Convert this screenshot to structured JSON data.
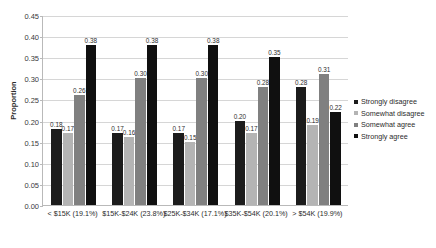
{
  "chart_data": {
    "type": "bar",
    "title": "",
    "xlabel": "",
    "ylabel": "Proportion",
    "ylim": [
      0.0,
      0.45
    ],
    "ytick_step": 0.05,
    "grid": true,
    "legend_position": "right",
    "categories": [
      "< $15K (19.1%)",
      "$15K-$24K (23.8%)",
      "$25K-$34K (17.1%)",
      "$35K-$54K (20.1%)",
      "> $54K (19.9%)"
    ],
    "ytick_labels": [
      "0.00",
      "0.05",
      "0.10",
      "0.15",
      "0.20",
      "0.25",
      "0.30",
      "0.35",
      "0.40",
      "0.45"
    ],
    "ytick_values": [
      0.0,
      0.05,
      0.1,
      0.15,
      0.2,
      0.25,
      0.3,
      0.35,
      0.4,
      0.45
    ],
    "series": [
      {
        "name": "Strongly disagree",
        "color": "#1c1c1c",
        "values": [
          0.18,
          0.17,
          0.17,
          0.2,
          0.28
        ],
        "labels": [
          "0.18",
          "0.17",
          "0.17",
          "0.20",
          "0.28"
        ]
      },
      {
        "name": "Somewhat disagree",
        "color": "#b4b4b4",
        "values": [
          0.17,
          0.16,
          0.15,
          0.17,
          0.19
        ],
        "labels": [
          "0.17",
          "0.16",
          "0.15",
          "0.17",
          "0.19"
        ]
      },
      {
        "name": "Somewhat agree",
        "color": "#808080",
        "values": [
          0.26,
          0.3,
          0.3,
          0.28,
          0.31
        ],
        "labels": [
          "0.26",
          "0.30",
          "0.30",
          "0.28",
          "0.31"
        ]
      },
      {
        "name": "Strongly agree",
        "color": "#101010",
        "values": [
          0.38,
          0.38,
          0.38,
          0.35,
          0.22
        ],
        "labels": [
          "0.38",
          "0.38",
          "0.38",
          "0.35",
          "0.22"
        ]
      }
    ]
  }
}
